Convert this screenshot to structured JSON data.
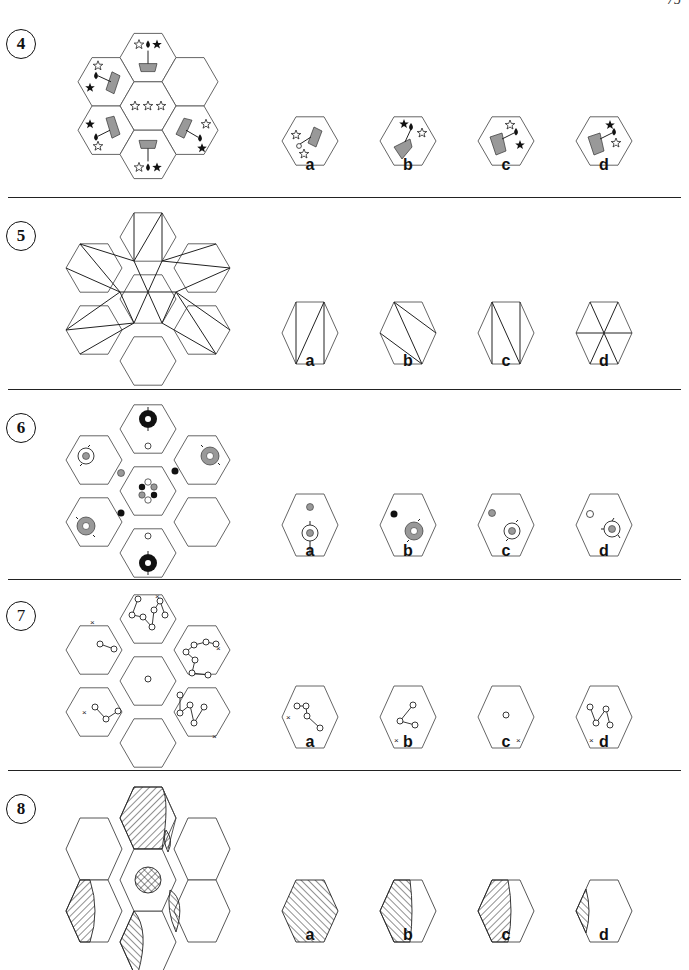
{
  "page": {
    "number": "75"
  },
  "questions": [
    {
      "number": "4",
      "options": [
        {
          "label": "a"
        },
        {
          "label": "b"
        },
        {
          "label": "c"
        },
        {
          "label": "d"
        }
      ]
    },
    {
      "number": "5",
      "options": [
        {
          "label": "a"
        },
        {
          "label": "b"
        },
        {
          "label": "c"
        },
        {
          "label": "d"
        }
      ]
    },
    {
      "number": "6",
      "options": [
        {
          "label": "a"
        },
        {
          "label": "b"
        },
        {
          "label": "c"
        },
        {
          "label": "d"
        }
      ]
    },
    {
      "number": "7",
      "options": [
        {
          "label": "a"
        },
        {
          "label": "b"
        },
        {
          "label": "c"
        },
        {
          "label": "d"
        }
      ]
    },
    {
      "number": "8",
      "options": [
        {
          "label": "a"
        },
        {
          "label": "b"
        },
        {
          "label": "c"
        },
        {
          "label": "d"
        }
      ]
    }
  ],
  "colors": {
    "line": "#222222",
    "shape_gray": "#999999",
    "hex_stroke": "#555555"
  }
}
